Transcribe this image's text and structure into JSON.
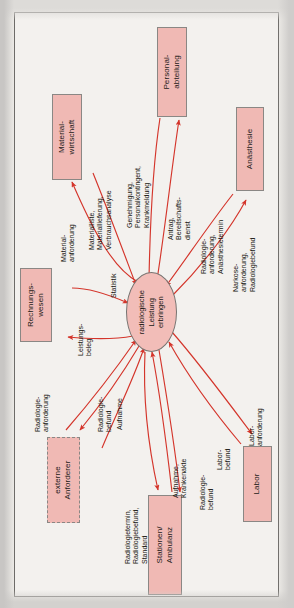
{
  "figure": {
    "type": "data-flow-diagram",
    "language": "de",
    "orientation": "rotated-90-ccw",
    "colors": {
      "entity_fill": "#f0b9b4",
      "process_fill": "#f2bdb8",
      "flow_arrow": "#d4352b",
      "border": "#8a8784",
      "page": "#f3f1ee"
    },
    "process": {
      "id": "radiologische-leistung-erbringen",
      "lines": [
        "radiologische",
        "Leistung",
        "erbringen"
      ],
      "shape": "ellipse"
    },
    "entities": [
      {
        "id": "materialwirtschaft",
        "lines": [
          "Material-",
          "wirtschaft"
        ],
        "border": "solid"
      },
      {
        "id": "personalabteilung",
        "lines": [
          "Personal-",
          "abteilung"
        ],
        "border": "solid"
      },
      {
        "id": "anaesthesie",
        "lines": [
          "Anästhesie"
        ],
        "border": "solid"
      },
      {
        "id": "rechnungswesen",
        "lines": [
          "Rechnungs-",
          "wesen"
        ],
        "border": "solid"
      },
      {
        "id": "externe-anforderer",
        "lines": [
          "externe",
          "Anforderer"
        ],
        "border": "dashed"
      },
      {
        "id": "stationen-ambulanz",
        "lines": [
          "Stationen/",
          "Ambulanz"
        ],
        "border": "solid"
      },
      {
        "id": "labor",
        "lines": [
          "Labor"
        ],
        "border": "solid"
      }
    ],
    "flows": [
      {
        "id": "f1",
        "lines": [
          "Material-",
          "anforderung"
        ],
        "from": "radiologische-leistung-erbringen",
        "to": "materialwirtschaft"
      },
      {
        "id": "f2",
        "lines": [
          "Materialliste,",
          "Materiallieferung,",
          "Verbrauchsanalyse"
        ],
        "from": "materialwirtschaft",
        "to": "radiologische-leistung-erbringen"
      },
      {
        "id": "f3",
        "lines": [
          "Genehmigung,",
          "Personalkontingent,",
          "Krankmeldung"
        ],
        "from": "personalabteilung",
        "to": "radiologische-leistung-erbringen"
      },
      {
        "id": "f4",
        "lines": [
          "Antrag,",
          "Bereitschafts-",
          "dienst"
        ],
        "from": "radiologische-leistung-erbringen",
        "to": "personalabteilung"
      },
      {
        "id": "f5",
        "lines": [
          "Radiologie-",
          "anforderung,",
          "Anästhesietermin"
        ],
        "from": "anaesthesie",
        "to": "radiologische-leistung-erbringen"
      },
      {
        "id": "f6",
        "lines": [
          "Narkose-",
          "anforderung,",
          "Radiologiebefund"
        ],
        "from": "radiologische-leistung-erbringen",
        "to": "anaesthesie"
      },
      {
        "id": "f7",
        "lines": [
          "Statistik"
        ],
        "from": "rechnungswesen",
        "to": "radiologische-leistung-erbringen"
      },
      {
        "id": "f8",
        "lines": [
          "Leistungs-",
          "beleg"
        ],
        "from": "radiologische-leistung-erbringen",
        "to": "rechnungswesen"
      },
      {
        "id": "f9",
        "lines": [
          "Radiologie-",
          "anforderung"
        ],
        "from": "externe-anforderer",
        "to": "radiologische-leistung-erbringen"
      },
      {
        "id": "f10",
        "lines": [
          "Radiologie-",
          "befund"
        ],
        "from": "radiologische-leistung-erbringen",
        "to": "externe-anforderer"
      },
      {
        "id": "f11",
        "lines": [
          "Aufnahme"
        ],
        "from": "externe-anforderer",
        "to": "radiologische-leistung-erbringen"
      },
      {
        "id": "f12",
        "lines": [
          "Radiologietermin,",
          "Radiologiebefund,",
          "Standard"
        ],
        "from": "radiologische-leistung-erbringen",
        "to": "stationen-ambulanz"
      },
      {
        "id": "f13",
        "lines": [
          "Aufnahme,",
          "Krankenakte"
        ],
        "from": "stationen-ambulanz",
        "to": "radiologische-leistung-erbringen"
      },
      {
        "id": "f14",
        "lines": [
          "Radiologie-",
          "befund"
        ],
        "from": "radiologische-leistung-erbringen",
        "to": "stationen-ambulanz"
      },
      {
        "id": "f15",
        "lines": [
          "Labor-",
          "befund"
        ],
        "from": "labor",
        "to": "radiologische-leistung-erbringen"
      },
      {
        "id": "f16",
        "lines": [
          "Labor-",
          "anforderung"
        ],
        "from": "radiologische-leistung-erbringen",
        "to": "labor"
      }
    ]
  }
}
